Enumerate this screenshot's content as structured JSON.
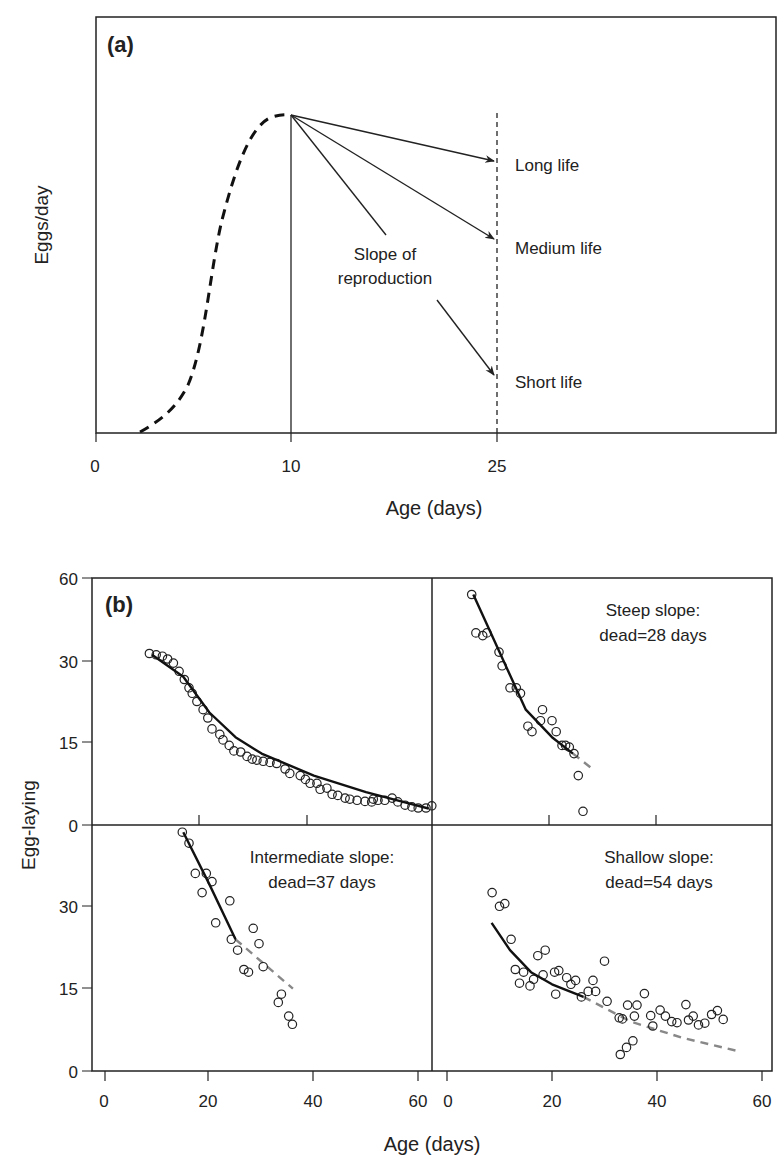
{
  "figure": {
    "panel_a": {
      "label": "(a)",
      "ylabel": "Eggs/day",
      "xlabel": "Age (days)",
      "xticks": [
        "0",
        "10",
        "25"
      ],
      "annotation": [
        "Slope of",
        "reproduction"
      ],
      "outcomes": [
        "Long life",
        "Medium life",
        "Short life"
      ]
    },
    "panel_b": {
      "label": "(b)",
      "ylabel": "Egg-laying",
      "xlabel": "Age (days)",
      "yticks": [
        "60",
        "30",
        "15",
        "0"
      ],
      "lower_yticks": [
        "0",
        "30",
        "15",
        "0"
      ],
      "xticks": [
        "0",
        "20",
        "40",
        "60"
      ],
      "steep": [
        "Steep slope:",
        "dead=28 days"
      ],
      "intermediate": [
        "Intermediate slope:",
        "dead=37 days"
      ],
      "shallow": [
        "Shallow slope:",
        "dead=54 days"
      ]
    }
  },
  "chart_data": [
    {
      "type": "line",
      "title": "(a)",
      "xlabel": "Age (days)",
      "ylabel": "Eggs/day",
      "xticks": [
        0,
        10,
        25
      ],
      "series": [
        {
          "name": "Rise to peak (dashed)",
          "style": "dashed",
          "x": [
            2.5,
            4,
            5.5,
            6.5,
            7.5,
            8.5,
            9.2,
            10
          ],
          "y_relative": [
            0,
            0.1,
            0.3,
            0.55,
            0.78,
            0.93,
            0.99,
            1.0
          ]
        },
        {
          "name": "Long life",
          "x": [
            10,
            25
          ],
          "y_relative": [
            1.0,
            0.85
          ]
        },
        {
          "name": "Medium life",
          "x": [
            10,
            25
          ],
          "y_relative": [
            1.0,
            0.62
          ]
        },
        {
          "name": "Short life",
          "x": [
            10,
            25
          ],
          "y_relative": [
            1.0,
            0.17
          ]
        }
      ],
      "annotations": [
        "Slope of reproduction",
        "Long life",
        "Medium life",
        "Short life"
      ],
      "reference_lines": [
        {
          "x": 10,
          "style": "solid"
        },
        {
          "x": 25,
          "style": "dashed"
        }
      ]
    },
    {
      "type": "scatter",
      "title": "(b) All flies",
      "xlabel": "Age (days)",
      "ylabel": "Egg-laying",
      "yticks": [
        0,
        15,
        30,
        60
      ],
      "xlim": [
        -2,
        63
      ],
      "points": [
        [
          8.5,
          32.5
        ],
        [
          9.8,
          32
        ],
        [
          11,
          31.5
        ],
        [
          12,
          30.5
        ],
        [
          13.1,
          29.5
        ],
        [
          14.2,
          28
        ],
        [
          15.2,
          26.5
        ],
        [
          16.1,
          25
        ],
        [
          16.7,
          24
        ],
        [
          17.6,
          22.5
        ],
        [
          18.8,
          21
        ],
        [
          19.7,
          19.5
        ],
        [
          20.5,
          17.5
        ],
        [
          22,
          16.5
        ],
        [
          22.6,
          15.5
        ],
        [
          23.8,
          14.5
        ],
        [
          24.7,
          13.5
        ],
        [
          26,
          13.3
        ],
        [
          27.2,
          12.5
        ],
        [
          28.2,
          12
        ],
        [
          29.1,
          11.8
        ],
        [
          30.3,
          11.6
        ],
        [
          31.6,
          11.4
        ],
        [
          32.9,
          11.2
        ],
        [
          34.5,
          10.2
        ],
        [
          35.4,
          9.4
        ],
        [
          37.4,
          9
        ],
        [
          38.4,
          8.3
        ],
        [
          39.3,
          7.6
        ],
        [
          40.6,
          7.6
        ],
        [
          41.2,
          6.5
        ],
        [
          42.5,
          6.7
        ],
        [
          43.5,
          5.6
        ],
        [
          44.6,
          5.4
        ],
        [
          46,
          4.9
        ],
        [
          46.9,
          4.7
        ],
        [
          48.3,
          4.5
        ],
        [
          49.8,
          4.3
        ],
        [
          51.1,
          4.2
        ],
        [
          51.4,
          4.7
        ],
        [
          52.3,
          4.5
        ],
        [
          53.6,
          4.5
        ],
        [
          55,
          4.9
        ],
        [
          56.1,
          4.2
        ],
        [
          57.5,
          3.6
        ],
        [
          58.8,
          3.3
        ],
        [
          60,
          3.1
        ],
        [
          61.5,
          3.1
        ],
        [
          62.6,
          3.5
        ]
      ],
      "fit": {
        "x": [
          9,
          15,
          20,
          25,
          30,
          40,
          50,
          60,
          62
        ],
        "y": [
          32,
          27,
          20.5,
          16,
          13,
          9,
          6,
          3.5,
          3
        ]
      }
    },
    {
      "type": "scatter",
      "title": "Steep slope: dead=28 days",
      "points": [
        [
          4.7,
          54
        ],
        [
          5.5,
          40
        ],
        [
          6.8,
          39
        ],
        [
          7.6,
          40
        ],
        [
          9.9,
          33
        ],
        [
          10.5,
          29
        ],
        [
          12,
          25
        ],
        [
          13.2,
          25
        ],
        [
          14,
          24
        ],
        [
          15.4,
          18
        ],
        [
          16.2,
          17
        ],
        [
          18.2,
          21
        ],
        [
          17.8,
          19
        ],
        [
          20,
          19
        ],
        [
          20.8,
          17
        ],
        [
          21.9,
          14.5
        ],
        [
          22.6,
          14.5
        ],
        [
          23.3,
          14.2
        ],
        [
          24.2,
          13
        ],
        [
          25,
          9
        ],
        [
          25.9,
          2.5
        ]
      ],
      "fit": {
        "x": [
          5,
          10,
          15,
          20,
          24
        ],
        "y": [
          54,
          33,
          21,
          16,
          13
        ]
      },
      "extrapolation": {
        "x": [
          24,
          28
        ],
        "y": [
          13,
          10
        ],
        "style": "dashed-gray"
      }
    },
    {
      "type": "scatter",
      "title": "Intermediate slope: dead=37 days",
      "points": [
        [
          14.8,
          57
        ],
        [
          16.1,
          53
        ],
        [
          17.3,
          42
        ],
        [
          18.6,
          35
        ],
        [
          19.4,
          42
        ],
        [
          20.5,
          39
        ],
        [
          21.2,
          27
        ],
        [
          23.9,
          32
        ],
        [
          24.2,
          24
        ],
        [
          25.4,
          22
        ],
        [
          26.6,
          18.5
        ],
        [
          27.5,
          18
        ],
        [
          28.4,
          26
        ],
        [
          29.5,
          23.2
        ],
        [
          30.3,
          19
        ],
        [
          33.8,
          14
        ],
        [
          33.2,
          12.5
        ],
        [
          35.2,
          10
        ],
        [
          35.9,
          8.5
        ]
      ],
      "fit": {
        "x": [
          15,
          20,
          25
        ],
        "y": [
          57,
          38,
          24
        ]
      },
      "extrapolation": {
        "x": [
          25,
          36
        ],
        "y": [
          24,
          15
        ],
        "style": "dashed-gray"
      }
    },
    {
      "type": "scatter",
      "title": "Shallow slope: dead=54 days",
      "points": [
        [
          8.6,
          35
        ],
        [
          10,
          30
        ],
        [
          11,
          31
        ],
        [
          12.2,
          24
        ],
        [
          13,
          18.5
        ],
        [
          13.8,
          16
        ],
        [
          14.6,
          18
        ],
        [
          15.8,
          15.5
        ],
        [
          16.5,
          16.7
        ],
        [
          17.3,
          21
        ],
        [
          18.3,
          17.5
        ],
        [
          18.7,
          22
        ],
        [
          20.5,
          18
        ],
        [
          20.7,
          14
        ],
        [
          21.3,
          18.3
        ],
        [
          22.8,
          17
        ],
        [
          23.6,
          15.8
        ],
        [
          24.5,
          16.5
        ],
        [
          25.6,
          13.5
        ],
        [
          26.9,
          14.5
        ],
        [
          27.8,
          16.5
        ],
        [
          28.3,
          14.5
        ],
        [
          30,
          20
        ],
        [
          30.5,
          12.7
        ],
        [
          32.8,
          9.7
        ],
        [
          33.4,
          9.5
        ],
        [
          34.4,
          12
        ],
        [
          35.7,
          10
        ],
        [
          36.2,
          12
        ],
        [
          37.6,
          14.1
        ],
        [
          38.8,
          10.1
        ],
        [
          39.2,
          8.2
        ],
        [
          40.6,
          11.1
        ],
        [
          41.6,
          10
        ],
        [
          42.8,
          9
        ],
        [
          43.8,
          8.8
        ],
        [
          45.5,
          12.1
        ],
        [
          46,
          9.3
        ],
        [
          46.9,
          10
        ],
        [
          47.9,
          8.4
        ],
        [
          49.1,
          8.7
        ],
        [
          50.4,
          10.3
        ],
        [
          51.5,
          11
        ],
        [
          52.6,
          9.4
        ],
        [
          33,
          3
        ],
        [
          34.2,
          4.3
        ],
        [
          35.4,
          5.5
        ]
      ],
      "fit": {
        "x": [
          8.5,
          12,
          16,
          20,
          26
        ],
        "y": [
          27,
          22,
          18,
          15.8,
          13.5
        ]
      },
      "extrapolation": {
        "x": [
          26,
          35,
          45,
          56
        ],
        "y": [
          13.5,
          9,
          6,
          3.5
        ],
        "style": "dashed-gray"
      }
    }
  ]
}
